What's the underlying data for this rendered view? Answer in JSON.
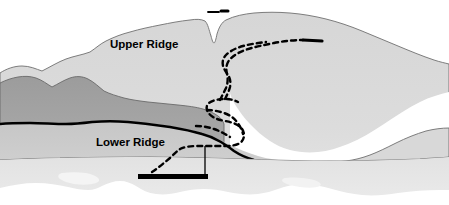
{
  "figure": {
    "type": "terrain-profile-illustration",
    "width": 449,
    "height": 205
  },
  "labels": {
    "upper_ridge": "Upper Ridge",
    "lower_ridge": "Lower Ridge"
  },
  "colors": {
    "background": "#ffffff",
    "sky": "#ffffff",
    "upper_ridge_fill": "#d2d2d2",
    "upper_ridge_fill_light": "#dedede",
    "dark_ridge_fill": "#a2a2a2",
    "mid_slope_fill": "#c8c8c8",
    "water_fill": "#e0e0e0",
    "water_highlight": "#ffffff",
    "outline": "#555555",
    "contour_heavy": "#000000",
    "route_dashed": "#000000",
    "boat": "#000000",
    "label_text": "#000000"
  },
  "elements": {
    "upper_ridge_silhouette": "large light-gray ridge mass spanning full width with a V notch near top center",
    "dark_ridge": "darker gray foreground ridge on the left half",
    "heavy_contour": "thick black contour line marking the lower ridge crest",
    "shore_line": "thin gray line separating land from water",
    "water": "light gray water band at the bottom with white irregular highlights",
    "dashed_route": "dashed ascent route from the boat up the gully and along the upper ridge to the right",
    "route_top_marker": "short solid dash-dot marker above the ridge notch",
    "route_end_marker": "short solid thick dash at the upper right end of the dashed route",
    "boat": "thick black horizontal hull bar with a thin vertical mast",
    "mast": "thin vertical line rising from the boat hull"
  },
  "markers": {
    "top_marker_label": "route-top-marker",
    "end_marker_label": "route-end-marker"
  }
}
